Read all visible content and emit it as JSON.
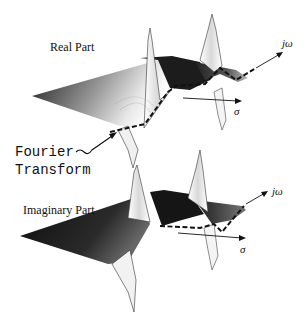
{
  "figure": {
    "title_top": "Real Part",
    "title_bottom": "Imaginary Part",
    "annotation_line1": "Fourier",
    "annotation_line2": "Transform",
    "axis_jw_top": "jω",
    "axis_sigma_top": "σ",
    "axis_jw_bottom": "jω",
    "axis_sigma_bottom": "σ"
  },
  "colors": {
    "surface_dark": "#111111",
    "surface_mid": "#666666",
    "line": "#1a1a1a",
    "background": "#ffffff"
  }
}
